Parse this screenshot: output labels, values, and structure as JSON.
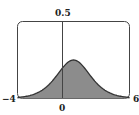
{
  "chart_data": {
    "type": "area",
    "title": "",
    "xlabel": "",
    "ylabel": "",
    "xlim": [
      -4,
      6
    ],
    "ylim": [
      0,
      0.5
    ],
    "x_tick_labels": [
      "-4",
      "0",
      "6"
    ],
    "y_tick_labels": [
      "0.5"
    ],
    "grid": false,
    "legend": null,
    "series": [
      {
        "name": "density",
        "x": [
          -4,
          -3,
          -2,
          -1,
          0,
          0.5,
          1,
          1.5,
          2,
          3,
          4,
          5,
          6
        ],
        "y": [
          0.007,
          0.018,
          0.045,
          0.105,
          0.197,
          0.235,
          0.25,
          0.235,
          0.197,
          0.105,
          0.045,
          0.018,
          0.007
        ]
      }
    ],
    "fill_color": "#8c8c8c",
    "line_color": "#333333"
  },
  "labels": {
    "y_max": "0.5",
    "x_min": "−4",
    "x_zero": "0",
    "x_max": "6"
  }
}
